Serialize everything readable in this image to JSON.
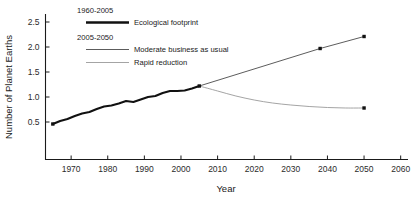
{
  "chart_data": {
    "type": "line",
    "title": "",
    "xlabel": "Year",
    "ylabel": "Number of Planet Earths",
    "xlim": [
      1963,
      2062
    ],
    "ylim": [
      0.0,
      2.72
    ],
    "grid": false,
    "legend_position": "top-center",
    "xticks": [
      "1970",
      "1980",
      "1990",
      "2000",
      "2010",
      "2020",
      "2030",
      "2040",
      "2050",
      "2060"
    ],
    "yticks": [
      "0.5",
      "1.0",
      "1.5",
      "2.0",
      "2.5"
    ],
    "legend_groups": [
      {
        "heading": "1960-2005",
        "entries": [
          {
            "label": "Ecological footprint",
            "style": "thick-black"
          }
        ]
      },
      {
        "heading": "2005-2050",
        "entries": [
          {
            "label": "Moderate business as usual",
            "style": "thin-dark"
          },
          {
            "label": "Rapid reduction",
            "style": "thin-light"
          }
        ]
      }
    ],
    "series": [
      {
        "name": "Ecological footprint",
        "period": "1960-2005",
        "x": [
          1965,
          1967,
          1969,
          1971,
          1973,
          1975,
          1977,
          1979,
          1981,
          1983,
          1985,
          1987,
          1989,
          1991,
          1993,
          1995,
          1997,
          1999,
          2001,
          2003,
          2005
        ],
        "values": [
          0.46,
          0.52,
          0.56,
          0.62,
          0.67,
          0.7,
          0.76,
          0.81,
          0.83,
          0.87,
          0.92,
          0.9,
          0.95,
          1.0,
          1.02,
          1.08,
          1.12,
          1.12,
          1.13,
          1.17,
          1.22
        ],
        "markers": [
          {
            "x": 1965,
            "y": 0.46
          },
          {
            "x": 2005,
            "y": 1.22
          }
        ]
      },
      {
        "name": "Moderate business as usual",
        "period": "2005-2050",
        "x": [
          2005,
          2038,
          2050
        ],
        "values": [
          1.22,
          1.97,
          2.21
        ],
        "markers": [
          {
            "x": 2038,
            "y": 1.97
          },
          {
            "x": 2050,
            "y": 2.21
          }
        ]
      },
      {
        "name": "Rapid reduction",
        "period": "2005-2050",
        "x": [
          2005,
          2010,
          2015,
          2020,
          2025,
          2030,
          2035,
          2040,
          2045,
          2050
        ],
        "values": [
          1.22,
          1.12,
          1.02,
          0.94,
          0.88,
          0.84,
          0.81,
          0.79,
          0.78,
          0.78
        ],
        "markers": [
          {
            "x": 2050,
            "y": 0.78
          }
        ]
      }
    ]
  }
}
